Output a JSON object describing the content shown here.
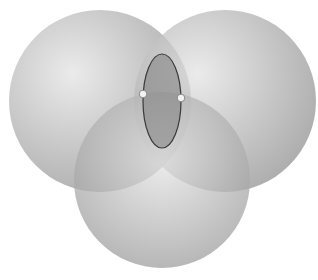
{
  "diagram": {
    "type": "venn",
    "background": "#ffffff",
    "circles": [
      {
        "id": "left",
        "cx": 100,
        "cy": 101,
        "r": 91,
        "highlight": {
          "x": 0.35,
          "y": 0.35
        }
      },
      {
        "id": "right",
        "cx": 225,
        "cy": 101,
        "r": 91,
        "highlight": {
          "x": 0.35,
          "y": 0.35
        }
      },
      {
        "id": "bottom",
        "cx": 162,
        "cy": 180,
        "r": 88,
        "highlight": {
          "x": 0.5,
          "y": 0.4
        }
      }
    ],
    "circle_colors": {
      "light": "#e4e4e4",
      "dark": "#8e8e8e",
      "opacity": 0.75
    },
    "ellipse": {
      "cx": 162,
      "cy": 101,
      "rx": 19,
      "ry": 47,
      "fill": "#7e7e7e",
      "stroke": "#3a3a3a"
    },
    "points": [
      {
        "id": "point-left",
        "cx": 143,
        "cy": 94,
        "r": 3.8
      },
      {
        "id": "point-right",
        "cx": 181,
        "cy": 98,
        "r": 3.8
      }
    ],
    "point_colors": {
      "fill": "#f2f2f2",
      "stroke": "#8a8a8a"
    }
  }
}
